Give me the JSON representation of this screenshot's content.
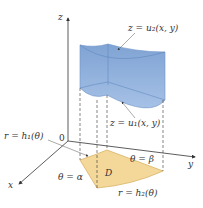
{
  "figure": {
    "axes": {
      "z_label": "z",
      "y_label": "y",
      "x_label": "x",
      "origin_label": "0"
    },
    "labels": {
      "upper_surface": "z = u₂(x, y)",
      "lower_surface": "z = u₁(x, y)",
      "inner_curve": "r = h₁(θ)",
      "outer_curve": "r = h₂(θ)",
      "angle_alpha": "θ = α",
      "angle_beta": "θ = β",
      "region": "D"
    },
    "colors": {
      "solid_fill": "#8fb0dc",
      "solid_dark": "#6e93c6",
      "region_fill": "#f3d89a",
      "region_edge": "#d9b264",
      "axis": "#333333"
    }
  }
}
